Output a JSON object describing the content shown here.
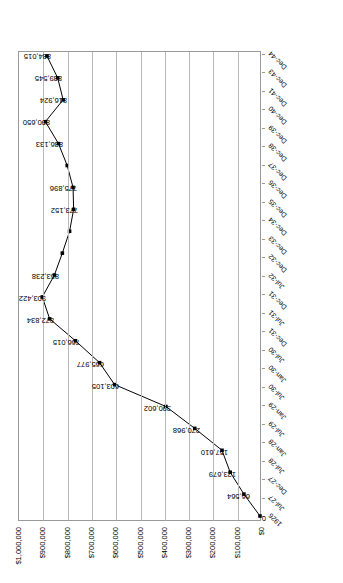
{
  "chart_data": {
    "type": "line",
    "title": "",
    "subtitle": "",
    "xlabel": "",
    "ylabel": "",
    "grid": true,
    "legend": "none",
    "ylim": [
      0,
      1000000
    ],
    "ytick_labels": [
      "$1,000,000",
      "$900,000",
      "$800,000",
      "$700,000",
      "$600,000",
      "$500,000",
      "$400,000",
      "$300,000",
      "$200,000",
      "$100,000",
      "$0"
    ],
    "ytick_values": [
      1000000,
      900000,
      800000,
      700000,
      600000,
      500000,
      400000,
      300000,
      200000,
      100000,
      0
    ],
    "categories": [
      "1926",
      "Jul-27",
      "Dec-27",
      "Jul-28",
      "Jan-28",
      "Jul-29",
      "Jan-29",
      "Jul-30",
      "Jan-30",
      "Jul-30",
      "Dec-31",
      "Jul-31",
      "Dec-31",
      "Jul-32",
      "Dec-32",
      "Dec-33",
      "Dec-34",
      "Dec-35",
      "Dec-36",
      "Dec-37",
      "Dec-38",
      "Dec-39",
      "Dec-40",
      "Dec-41",
      "Dec-43",
      "Dec-44"
    ],
    "points": [
      {
        "category": "1926",
        "value": 0,
        "label": "0"
      },
      {
        "category": "Jul-27",
        "value": 66564,
        "label": "66,564"
      },
      {
        "category": "Dec-27",
        "value": 123679,
        "label": "123,679"
      },
      {
        "category": "Jul-28",
        "value": 157610,
        "label": "157,610"
      },
      {
        "category": "Jan-29",
        "value": 270968,
        "label": "270,968"
      },
      {
        "category": "Jul-29",
        "value": 390602,
        "label": "390,602"
      },
      {
        "category": "Jan-30",
        "value": 603105,
        "label": "603,105"
      },
      {
        "category": "Jul-30",
        "value": 665977,
        "label": "665,977"
      },
      {
        "category": "Dec-31",
        "value": 766015,
        "label": "766,015"
      },
      {
        "category": "Jul-31",
        "value": 872834,
        "label": "872,834"
      },
      {
        "category": "Dec-32",
        "value": 903422,
        "label": "903,422"
      },
      {
        "category": "Jul-32",
        "value": 853238,
        "label": "853,238"
      },
      {
        "category": "Dec-33",
        "value": 820000,
        "label": ""
      },
      {
        "category": "Dec-34",
        "value": 790000,
        "label": ""
      },
      {
        "category": "Dec-35",
        "value": 773152,
        "label": "773,152"
      },
      {
        "category": "Dec-36",
        "value": 775896,
        "label": "775,896"
      },
      {
        "category": "Dec-37",
        "value": 800000,
        "label": ""
      },
      {
        "category": "Dec-38",
        "value": 836133,
        "label": "836,133"
      },
      {
        "category": "Dec-39",
        "value": 890650,
        "label": "890,650"
      },
      {
        "category": "Dec-40",
        "value": 816924,
        "label": "816,924"
      },
      {
        "category": "Dec-41",
        "value": 839545,
        "label": "839,545"
      },
      {
        "category": "Dec-43",
        "value": 884015,
        "label": "884,015"
      }
    ],
    "series_color": "#000000",
    "marker_color": "#000000",
    "grid_color": "#b9b9b9",
    "axis_color": "#9a9a9a"
  }
}
